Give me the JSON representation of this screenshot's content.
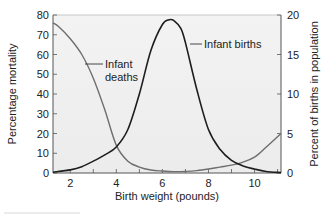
{
  "chart_data": {
    "type": "line",
    "title": "",
    "xlabel": "Birth weight (pounds)",
    "ylabel": "Percentage mortality",
    "y2label": "Percent of births in population",
    "xlim": [
      1.25,
      11.15
    ],
    "ylim": [
      0,
      80
    ],
    "y2lim": [
      0,
      20
    ],
    "xticks": [
      2,
      4,
      6,
      8,
      10
    ],
    "xminor_ticks": [
      2,
      3,
      4,
      5,
      6,
      7,
      8,
      9,
      10,
      11
    ],
    "yticks": [
      0,
      10,
      20,
      30,
      40,
      50,
      60,
      70,
      80
    ],
    "y2ticks": [
      0,
      5,
      10,
      15,
      20
    ],
    "grid": false,
    "legend": "none (inline annotations)",
    "series": [
      {
        "name": "Infant deaths",
        "axis": "left",
        "color": "#6e6e6e",
        "x": [
          1.25,
          1.5,
          2.0,
          2.5,
          3.0,
          3.5,
          4.0,
          4.5,
          5.0,
          5.5,
          6.0,
          6.5,
          7.0,
          7.5,
          8.0,
          8.5,
          9.0,
          9.5,
          10.0,
          10.5,
          11.15
        ],
        "values": [
          76,
          74,
          68,
          60,
          48,
          32,
          14,
          6,
          3,
          1.5,
          1,
          0.7,
          0.8,
          1.2,
          2,
          3,
          4,
          5.5,
          8,
          13,
          20
        ]
      },
      {
        "name": "Infant births",
        "axis": "right",
        "color": "#1e1e1e",
        "x": [
          1.25,
          2.0,
          2.5,
          3.0,
          3.5,
          4.0,
          4.5,
          5.0,
          5.5,
          6.0,
          6.3,
          6.5,
          6.8,
          7.0,
          7.5,
          8.0,
          8.5,
          9.0,
          9.5,
          10.0,
          10.5,
          11.15
        ],
        "values": [
          0.1,
          0.4,
          0.8,
          1.5,
          2.3,
          3.3,
          5.5,
          10,
          15.5,
          18.8,
          19.4,
          19.3,
          18.3,
          16.5,
          10.5,
          5.5,
          3.0,
          1.6,
          0.9,
          0.5,
          0.2,
          0.05
        ]
      }
    ],
    "annotations": [
      {
        "text_line1": "Infant",
        "text_line2": "deaths",
        "points_to": "Infant deaths",
        "x": 3.0,
        "y": 53
      },
      {
        "text": "Infant births",
        "points_to": "Infant births",
        "x": 7.2,
        "y": 15.8
      }
    ]
  },
  "labels": {
    "xlabel": "Birth weight (pounds)",
    "ylabel_left": "Percentage mortality",
    "ylabel_right": "Percent of births in population",
    "annot_deaths_1": "Infant",
    "annot_deaths_2": "deaths",
    "annot_births": "Infant births"
  }
}
